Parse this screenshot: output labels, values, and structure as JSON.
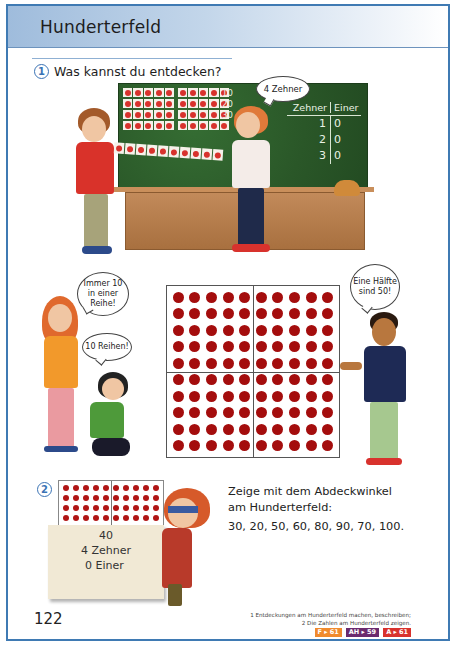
{
  "header": {
    "title": "Hunderterfeld"
  },
  "task1": {
    "number": "1",
    "instruction": "Was kannst du entdecken?",
    "speech_zehner": "4 Zehner",
    "board": {
      "card_rows": 4,
      "cards_per_row": 10,
      "row_labels": [
        "10",
        "20",
        "30"
      ],
      "table": {
        "headers": [
          "Zehner",
          "Einer"
        ],
        "rows": [
          [
            "1",
            "0"
          ],
          [
            "2",
            "0"
          ],
          [
            "3",
            "0"
          ]
        ]
      }
    }
  },
  "scene2": {
    "speech_immer": "Immer 10 in einer Reihe!",
    "speech_reihen": "10 Reihen!",
    "speech_haelfte": "Eine Hälfte sind 50!",
    "hundred_field": {
      "rows": 10,
      "cols": 10
    }
  },
  "task2": {
    "number": "2",
    "cover_card": {
      "value": "40",
      "tens": "4 Zehner",
      "ones": "0 Einer"
    },
    "instruction_line1": "Zeige mit dem Abdeckwinkel",
    "instruction_line2": "am Hunderterfeld:",
    "numbers": "30, 20, 50, 60, 80, 90, 70, 100.",
    "mini_field": {
      "rows": 4,
      "cols": 10
    }
  },
  "footer": {
    "page_number": "122",
    "footnote1": "1 Entdeckungen am Hunderterfeld machen, beschreiben;",
    "footnote2": "2 Die Zahlen am Hunderterfeld zeigen.",
    "badges": [
      {
        "label": "F ▸ 61",
        "color": "#f08a2e"
      },
      {
        "label": "AH ▸ 59",
        "color": "#6b2a6e"
      },
      {
        "label": "A ▸ 61",
        "color": "#d8322d"
      }
    ]
  },
  "colors": {
    "border": "#3f7ab3",
    "accent_blue": "#3a73b5",
    "dot_red": "#a40d0d",
    "chalkboard": "#2b5a2a"
  }
}
